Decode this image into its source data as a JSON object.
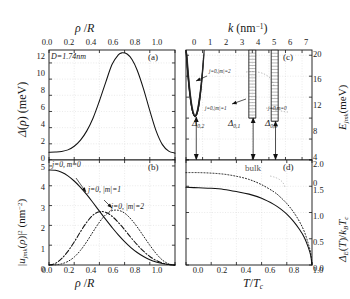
{
  "figure": {
    "panels": [
      "(a)",
      "(b)",
      "(c)",
      "(d)"
    ]
  },
  "panel_a": {
    "id": "(a)",
    "annotation": "D=1.74nm",
    "xlabel": "ρ /R",
    "ylabel": "Δ(ρ) (meV)",
    "xticks": [
      "0.0",
      "0.2",
      "0.4",
      "0.6",
      "0.8",
      "1.0"
    ],
    "yticks": [
      "0",
      "2",
      "4",
      "6",
      "8",
      "10",
      "12"
    ],
    "axis_position": "top"
  },
  "panel_b": {
    "id": "(b)",
    "xlabel": "ρ /R",
    "ylabel_parts": {
      "main": "|u",
      "sub1": "jmk",
      "mid": "(ρ)|",
      "sup": "2",
      "unit": " (nm",
      "unitsup": "-2",
      "close": ")"
    },
    "xticks": [
      "0.0",
      "0.2",
      "0.4",
      "0.6",
      "0.8",
      "1.0"
    ],
    "yticks": [
      "0",
      "1",
      "2",
      "3",
      "4",
      "5"
    ],
    "curve_labels": [
      {
        "text": "j=0, m=0",
        "style": "solid"
      },
      {
        "text": "j=0, |m|=1",
        "style": "dash-dot"
      },
      {
        "text": "j=0, |m|=2",
        "style": "dotted"
      }
    ]
  },
  "panel_c": {
    "id": "(c)",
    "xlabel_parts": {
      "k": "k",
      "unit": " (nm",
      "sup": "-1",
      "close": ")"
    },
    "ylabel_parts": {
      "E": "E",
      "sub": "jmk",
      "unit": "(meV)"
    },
    "xticks": [
      "0",
      "1",
      "2",
      "3",
      "4",
      "5",
      "6",
      "7"
    ],
    "yticks": [
      "0",
      "4",
      "8",
      "12",
      "16",
      "20"
    ],
    "band_labels": [
      {
        "text": "j=0,|m|=2"
      },
      {
        "text": "j=0,|m|=1"
      },
      {
        "text": "j=0,m=0"
      }
    ],
    "gap_labels": [
      {
        "base": "Δ",
        "sub": "0,2"
      },
      {
        "base": "Δ",
        "sub": "0,1"
      },
      {
        "base": "Δ",
        "sub": "0,0"
      }
    ]
  },
  "panel_d": {
    "id": "(d)",
    "xlabel_parts": {
      "main": "T/T",
      "sub": "c"
    },
    "ylabel_parts": {
      "d": "Δ",
      "sub1": "E",
      "mid": "(T)/k",
      "sub2": "B",
      "t": "T",
      "sub3": "c"
    },
    "annotation": "bulk",
    "xticks": [
      "0.0",
      "0.2",
      "0.4",
      "0.6",
      "0.8",
      "1.0"
    ],
    "yticks": [
      "0.0",
      "0.5",
      "1.0",
      "1.5",
      "2.0"
    ]
  },
  "chart_data": [
    {
      "type": "line",
      "panel": "(a)",
      "title": "Superconducting order parameter profile",
      "xlabel": "rho/R",
      "ylabel": "Delta(rho) (meV)",
      "xlim": [
        0,
        1
      ],
      "ylim": [
        0,
        13.6
      ],
      "grid": true,
      "annotation": "D=1.74nm",
      "series": [
        {
          "name": "Delta(rho)",
          "style": "solid",
          "x": [
            0.0,
            0.05,
            0.1,
            0.15,
            0.2,
            0.25,
            0.3,
            0.35,
            0.4,
            0.45,
            0.5,
            0.55,
            0.58,
            0.62,
            0.66,
            0.7,
            0.75,
            0.8,
            0.85,
            0.9,
            0.95,
            1.0
          ],
          "y": [
            0.95,
            0.98,
            1.05,
            1.25,
            1.7,
            2.45,
            3.6,
            5.2,
            7.3,
            9.6,
            11.8,
            13.0,
            13.25,
            13.1,
            12.4,
            11.1,
            8.8,
            6.1,
            3.6,
            1.9,
            1.1,
            0.85
          ]
        }
      ]
    },
    {
      "type": "line",
      "panel": "(b)",
      "title": "Radial probability densities",
      "xlabel": "rho/R",
      "ylabel": "|u_jmk(rho)|^2 (nm^-2)",
      "xlim": [
        0,
        1
      ],
      "ylim": [
        0,
        5.3
      ],
      "grid": true,
      "series": [
        {
          "name": "j=0, m=0",
          "style": "solid",
          "x": [
            0.0,
            0.05,
            0.1,
            0.15,
            0.2,
            0.25,
            0.3,
            0.35,
            0.4,
            0.45,
            0.5,
            0.55,
            0.6,
            0.65,
            0.7,
            0.75,
            0.8,
            0.85,
            0.9,
            0.95,
            1.0
          ],
          "y": [
            4.8,
            4.78,
            4.68,
            4.5,
            4.24,
            3.92,
            3.55,
            3.14,
            2.72,
            2.3,
            1.9,
            1.52,
            1.18,
            0.88,
            0.63,
            0.43,
            0.27,
            0.15,
            0.07,
            0.02,
            0.0
          ]
        },
        {
          "name": "j=0, |m|=1",
          "style": "dash-dot",
          "x": [
            0.0,
            0.05,
            0.1,
            0.15,
            0.2,
            0.25,
            0.3,
            0.35,
            0.4,
            0.45,
            0.5,
            0.55,
            0.6,
            0.65,
            0.7,
            0.75,
            0.8,
            0.85,
            0.9,
            0.95,
            1.0
          ],
          "y": [
            0.0,
            0.08,
            0.32,
            0.69,
            1.16,
            1.68,
            2.16,
            2.52,
            2.69,
            2.66,
            2.46,
            2.15,
            1.78,
            1.39,
            1.02,
            0.7,
            0.43,
            0.23,
            0.1,
            0.02,
            0.0
          ]
        },
        {
          "name": "j=0, |m|=2",
          "style": "dotted",
          "x": [
            0.0,
            0.05,
            0.1,
            0.15,
            0.2,
            0.25,
            0.3,
            0.35,
            0.4,
            0.45,
            0.5,
            0.55,
            0.6,
            0.65,
            0.7,
            0.75,
            0.8,
            0.85,
            0.9,
            0.95,
            1.0
          ],
          "y": [
            0.0,
            0.01,
            0.06,
            0.18,
            0.4,
            0.74,
            1.18,
            1.68,
            2.16,
            2.54,
            2.74,
            2.76,
            2.62,
            2.32,
            1.92,
            1.46,
            1.0,
            0.58,
            0.25,
            0.06,
            0.0
          ]
        }
      ]
    },
    {
      "type": "line",
      "panel": "(c)",
      "title": "Subband dispersions and gaps",
      "xlabel": "k (nm^-1)",
      "ylabel": "E_jmk (meV)",
      "xlim": [
        0,
        7.6
      ],
      "ylim": [
        0,
        21
      ],
      "grid": true,
      "bands": [
        {
          "name": "j=0,|m|=2",
          "k_min": 0.55,
          "E_bottom": 8.2,
          "E_top": 19.6,
          "width": 0.55
        },
        {
          "name": "j=0,|m|=1",
          "k_min": 4.0,
          "E_bottom": 8.0,
          "E_top": 19.8,
          "width": 0.42
        },
        {
          "name": "j=0,m=0",
          "k_min": 5.35,
          "E_bottom": 7.4,
          "E_top": 19.8,
          "width": 0.42
        }
      ],
      "gap_arrows": [
        {
          "label": "Delta_0,2",
          "k": 0.62,
          "from": 8.2,
          "to": 0.0
        },
        {
          "label": "Delta_0,1",
          "k": 4.05,
          "from": 8.0,
          "to": 0.0
        },
        {
          "label": "Delta_0,0",
          "k": 5.4,
          "from": 7.4,
          "to": 0.0
        }
      ]
    },
    {
      "type": "line",
      "panel": "(d)",
      "title": "Temperature dependence of the gap",
      "xlabel": "T/Tc",
      "ylabel": "Delta_E(T)/k_B T_c",
      "xlim": [
        0,
        1
      ],
      "ylim": [
        0,
        2.0
      ],
      "grid": true,
      "series": [
        {
          "name": "nanowire",
          "style": "solid",
          "x": [
            0.0,
            0.1,
            0.2,
            0.3,
            0.4,
            0.5,
            0.6,
            0.7,
            0.75,
            0.8,
            0.85,
            0.9,
            0.94,
            0.97,
            0.99,
            1.0
          ],
          "y": [
            1.48,
            1.47,
            1.46,
            1.44,
            1.4,
            1.35,
            1.27,
            1.15,
            1.07,
            0.97,
            0.84,
            0.68,
            0.52,
            0.34,
            0.18,
            0.0
          ]
        },
        {
          "name": "bulk",
          "style": "dotted",
          "x": [
            0.0,
            0.1,
            0.2,
            0.3,
            0.4,
            0.5,
            0.6,
            0.7,
            0.75,
            0.8,
            0.85,
            0.9,
            0.94,
            0.97,
            0.99,
            1.0
          ],
          "y": [
            1.76,
            1.76,
            1.75,
            1.73,
            1.69,
            1.63,
            1.53,
            1.39,
            1.29,
            1.17,
            1.02,
            0.83,
            0.63,
            0.41,
            0.22,
            0.0
          ]
        }
      ]
    }
  ]
}
